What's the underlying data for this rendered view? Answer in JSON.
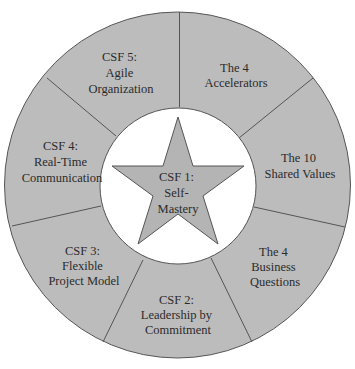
{
  "diagram": {
    "colors": {
      "ring_fill": "#bcbcbc",
      "star_fill": "#b4b4b4",
      "inner_fill": "#ffffff",
      "stroke": "#555555",
      "text": "#2b2b2b"
    },
    "center": {
      "lines": [
        "CSF 1:",
        "Self-",
        "Mastery"
      ]
    },
    "segments": [
      {
        "id": "csf5",
        "lines": [
          "CSF 5:",
          "Agile",
          "Organization"
        ]
      },
      {
        "id": "accelerators",
        "lines": [
          "The 4",
          "Accelerators"
        ]
      },
      {
        "id": "shared-values",
        "lines": [
          "The 10",
          "Shared Values"
        ]
      },
      {
        "id": "business-questions",
        "lines": [
          "The 4",
          "Business",
          "Questions"
        ]
      },
      {
        "id": "csf2",
        "lines": [
          "CSF 2:",
          "Leadership by",
          "Commitment"
        ]
      },
      {
        "id": "csf3",
        "lines": [
          "CSF 3:",
          "Flexible",
          "Project Model"
        ]
      },
      {
        "id": "csf4",
        "lines": [
          "CSF 4:",
          "Real-Time",
          "Communication"
        ]
      }
    ]
  }
}
